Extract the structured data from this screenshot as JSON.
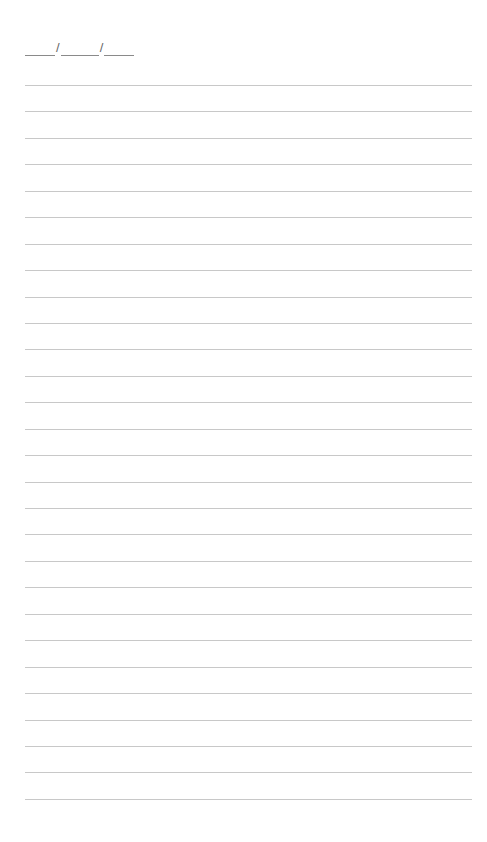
{
  "page": {
    "type": "lined-notebook-page",
    "background": "#ffffff",
    "line_color": "#c8c8c8"
  },
  "date_field": {
    "separator": "/",
    "blanks": [
      30,
      38,
      30
    ]
  },
  "ruled_lines": {
    "count": 28,
    "first_y": 85,
    "spacing": 26.44
  }
}
